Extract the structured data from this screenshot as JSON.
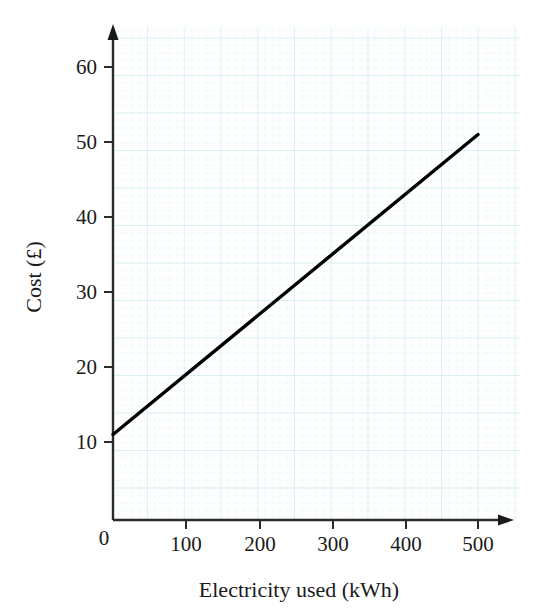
{
  "figure": {
    "background_color": "#ffffff",
    "ink_color": "#1a1a1a",
    "grid_minor_color": "#e2f4f7",
    "grid_major_color": "#cfeaf0",
    "axis_arrow_icon": "arrow-head-icon",
    "plot_area": {
      "x": 113,
      "y": 27,
      "width": 407,
      "height": 493
    }
  },
  "chart_data": {
    "type": "line",
    "title": "",
    "subtitle": "",
    "xlabel": "Electricity used (kWh)",
    "ylabel": "Cost (£)",
    "xlim": [
      0,
      550
    ],
    "ylim": [
      0,
      66
    ],
    "xticks": [
      0,
      100,
      200,
      300,
      400,
      500
    ],
    "xtick_labels": [
      "0",
      "100",
      "200",
      "300",
      "400",
      "500"
    ],
    "yticks": [
      0,
      10,
      20,
      30,
      40,
      50,
      60
    ],
    "ytick_labels": [
      "0",
      "10",
      "20",
      "30",
      "40",
      "50",
      "60"
    ],
    "ytick_labels_shown": [
      "10",
      "20",
      "30",
      "40",
      "50",
      "60"
    ],
    "origin_label": "0",
    "grid": true,
    "grid_style": "graph-paper",
    "legend": false,
    "legend_position": "none",
    "series": [
      {
        "name": "Cost of electricity",
        "color": "#000000",
        "line_width": 3,
        "x": [
          0,
          100,
          200,
          300,
          400,
          500
        ],
        "y": [
          11,
          19,
          27,
          35,
          43,
          51
        ],
        "intercept": 11,
        "slope_per_kwh": 0.08,
        "endpoints": [
          {
            "x": 0,
            "y": 11
          },
          {
            "x": 500,
            "y": 51
          }
        ]
      }
    ],
    "annotations": []
  }
}
